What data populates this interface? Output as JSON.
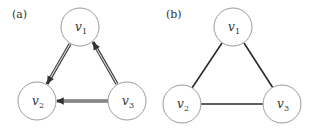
{
  "figure": {
    "panels": [
      {
        "id": "a",
        "label": "(a)",
        "type": "directed",
        "nodes": [
          {
            "id": "v1",
            "name": "v",
            "sub": "1",
            "cx": 80,
            "cy": 27
          },
          {
            "id": "v2",
            "name": "v",
            "sub": "2",
            "cx": 37,
            "cy": 101
          },
          {
            "id": "v3",
            "name": "v",
            "sub": "3",
            "cx": 127,
            "cy": 101
          }
        ],
        "edges": [
          {
            "from": "v1",
            "to": "v2",
            "style": "double-arrow"
          },
          {
            "from": "v3",
            "to": "v1",
            "style": "double-arrow"
          },
          {
            "from": "v3",
            "to": "v2",
            "style": "double-arrow"
          }
        ]
      },
      {
        "id": "b",
        "label": "(b)",
        "type": "undirected",
        "nodes": [
          {
            "id": "v1",
            "name": "v",
            "sub": "1",
            "cx": 233,
            "cy": 27
          },
          {
            "id": "v2",
            "name": "v",
            "sub": "2",
            "cx": 182,
            "cy": 104
          },
          {
            "id": "v3",
            "name": "v",
            "sub": "3",
            "cx": 282,
            "cy": 104
          }
        ],
        "edges": [
          {
            "from": "v1",
            "to": "v2",
            "style": "line"
          },
          {
            "from": "v1",
            "to": "v3",
            "style": "line"
          },
          {
            "from": "v2",
            "to": "v3",
            "style": "line"
          }
        ]
      }
    ],
    "node_radius": 19,
    "colors": {
      "node_stroke": "#9a9a9a",
      "edge": "#2a2a2a",
      "text": "#333333"
    }
  }
}
